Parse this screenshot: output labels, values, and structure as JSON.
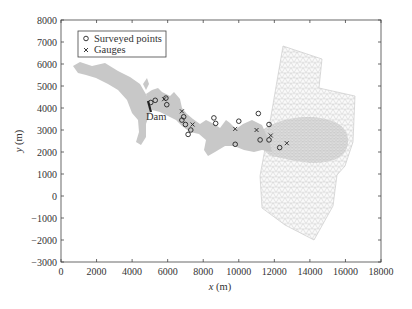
{
  "chart_data": {
    "type": "scatter",
    "title": "",
    "xlabel": "x (m)",
    "ylabel": "y (m)",
    "xlim": [
      0,
      18000
    ],
    "ylim": [
      -3000,
      8000
    ],
    "xticks": [
      0,
      2000,
      4000,
      6000,
      8000,
      10000,
      12000,
      14000,
      16000,
      18000
    ],
    "yticks": [
      -3000,
      -2000,
      -1000,
      0,
      1000,
      2000,
      3000,
      4000,
      5000,
      6000,
      7000,
      8000
    ],
    "grid": false,
    "legend_position": "upper left",
    "annotations": [
      {
        "text": "Dam",
        "x": 4900,
        "y": 3550
      }
    ],
    "series": [
      {
        "name": "Surveyed points",
        "marker": "circle",
        "points": [
          [
            5050,
            4250
          ],
          [
            5300,
            4350
          ],
          [
            5900,
            4450
          ],
          [
            5950,
            4150
          ],
          [
            6900,
            3600
          ],
          [
            6800,
            3450
          ],
          [
            7000,
            3250
          ],
          [
            7300,
            3000
          ],
          [
            7150,
            2800
          ],
          [
            8600,
            3550
          ],
          [
            8700,
            3300
          ],
          [
            9800,
            2350
          ],
          [
            10000,
            3400
          ],
          [
            11100,
            3750
          ],
          [
            11200,
            2550
          ],
          [
            11700,
            3250
          ],
          [
            11700,
            2550
          ],
          [
            12300,
            2200
          ]
        ]
      },
      {
        "name": "Gauges",
        "marker": "x",
        "points": [
          [
            5800,
            4400
          ],
          [
            6800,
            3850
          ],
          [
            7400,
            3250
          ],
          [
            9800,
            3050
          ],
          [
            11000,
            3000
          ],
          [
            11800,
            2750
          ],
          [
            12700,
            2400
          ]
        ]
      }
    ],
    "background": {
      "reservoir_fill": "#c8c8c8",
      "mesh_color": "#bdbdbd",
      "dam_marker_color": "#222222"
    }
  },
  "legend": {
    "items": [
      {
        "label": "Surveyed points",
        "symbol": "○"
      },
      {
        "label": "Gauges",
        "symbol": "×"
      }
    ]
  },
  "axis": {
    "xlabel_var": "x",
    "xlabel_unit": " (m)",
    "ylabel_var": "y",
    "ylabel_unit": " (m)"
  },
  "dam_label": "Dam"
}
